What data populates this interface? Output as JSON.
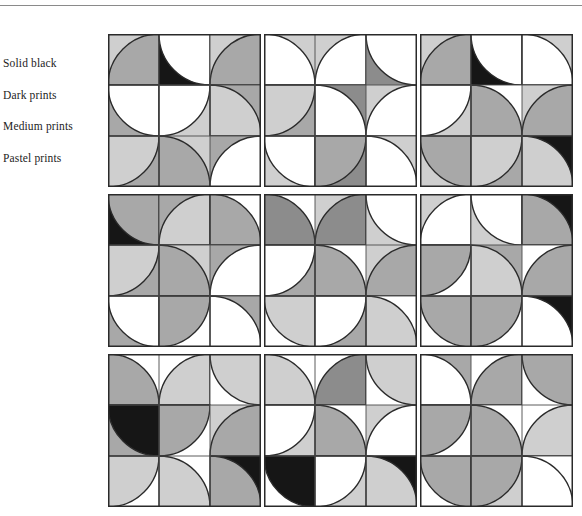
{
  "page": {
    "type": "quilt-block-value-study",
    "background_color": "#ffffff",
    "has_top_rule": true,
    "top_rule_color": "#8a8a8a"
  },
  "legend": {
    "items": [
      {
        "label": "Solid black",
        "value_key": "black",
        "color": "#161616"
      },
      {
        "label": "Dark prints",
        "value_key": "dark",
        "color": "#8c8c8c"
      },
      {
        "label": "Medium prints",
        "value_key": "medium",
        "color": "#a8a8a8"
      },
      {
        "label": "Pastel prints",
        "value_key": "pastel",
        "color": "#cfcfcf"
      }
    ]
  },
  "palette": {
    "black": "#161616",
    "dark": "#8c8c8c",
    "medium": "#a8a8a8",
    "pastel": "#cfcfcf",
    "white": "#ffffff",
    "outline": "#2a2a2a",
    "gridline": "#4a4a4a"
  },
  "quilt": {
    "rows": 3,
    "cols": 3,
    "block_cells": 3,
    "cell_size": 51,
    "description": "Nine drunkard's path sampler blocks; each block is a 3x3 grid of quarter-circle units rotated into pinwheel curves.",
    "blocks": [
      {
        "name": "block-1",
        "cells": [
          {
            "rot": 180,
            "arc": "medium",
            "bg": "pastel"
          },
          {
            "rot": 90,
            "arc": "white",
            "bg": "black"
          },
          {
            "rot": 180,
            "arc": "medium",
            "bg": "pastel"
          },
          {
            "rot": 90,
            "arc": "white",
            "bg": "medium"
          },
          {
            "rot": 0,
            "arc": "white",
            "bg": "pastel"
          },
          {
            "rot": 270,
            "arc": "pastel",
            "bg": "medium"
          },
          {
            "rot": 0,
            "arc": "pastel",
            "bg": "medium"
          },
          {
            "rot": 270,
            "arc": "medium",
            "bg": "pastel"
          },
          {
            "rot": 180,
            "arc": "white",
            "bg": "medium"
          }
        ]
      },
      {
        "name": "block-2",
        "cells": [
          {
            "rot": 270,
            "arc": "white",
            "bg": "pastel"
          },
          {
            "rot": 180,
            "arc": "white",
            "bg": "pastel"
          },
          {
            "rot": 90,
            "arc": "white",
            "bg": "dark"
          },
          {
            "rot": 0,
            "arc": "pastel",
            "bg": "medium"
          },
          {
            "rot": 270,
            "arc": "white",
            "bg": "dark"
          },
          {
            "rot": 180,
            "arc": "white",
            "bg": "pastel"
          },
          {
            "rot": 90,
            "arc": "white",
            "bg": "pastel"
          },
          {
            "rot": 0,
            "arc": "medium",
            "bg": "dark"
          },
          {
            "rot": 270,
            "arc": "white",
            "bg": "pastel"
          }
        ]
      },
      {
        "name": "block-3",
        "cells": [
          {
            "rot": 180,
            "arc": "medium",
            "bg": "pastel"
          },
          {
            "rot": 90,
            "arc": "white",
            "bg": "black"
          },
          {
            "rot": 270,
            "arc": "white",
            "bg": "pastel"
          },
          {
            "rot": 0,
            "arc": "white",
            "bg": "pastel"
          },
          {
            "rot": 270,
            "arc": "medium",
            "bg": "white"
          },
          {
            "rot": 180,
            "arc": "medium",
            "bg": "pastel"
          },
          {
            "rot": 90,
            "arc": "medium",
            "bg": "pastel"
          },
          {
            "rot": 0,
            "arc": "pastel",
            "bg": "medium"
          },
          {
            "rot": 270,
            "arc": "pastel",
            "bg": "black"
          }
        ]
      },
      {
        "name": "block-4",
        "cells": [
          {
            "rot": 90,
            "arc": "medium",
            "bg": "black"
          },
          {
            "rot": 180,
            "arc": "pastel",
            "bg": "medium"
          },
          {
            "rot": 270,
            "arc": "medium",
            "bg": "white"
          },
          {
            "rot": 0,
            "arc": "pastel",
            "bg": "medium"
          },
          {
            "rot": 270,
            "arc": "medium",
            "bg": "pastel"
          },
          {
            "rot": 180,
            "arc": "white",
            "bg": "medium"
          },
          {
            "rot": 90,
            "arc": "white",
            "bg": "medium"
          },
          {
            "rot": 0,
            "arc": "medium",
            "bg": "white"
          },
          {
            "rot": 270,
            "arc": "white",
            "bg": "medium"
          }
        ]
      },
      {
        "name": "block-5",
        "cells": [
          {
            "rot": 270,
            "arc": "dark",
            "bg": "white"
          },
          {
            "rot": 180,
            "arc": "dark",
            "bg": "pastel"
          },
          {
            "rot": 90,
            "arc": "white",
            "bg": "pastel"
          },
          {
            "rot": 0,
            "arc": "white",
            "bg": "medium"
          },
          {
            "rot": 270,
            "arc": "medium",
            "bg": "white"
          },
          {
            "rot": 180,
            "arc": "medium",
            "bg": "pastel"
          },
          {
            "rot": 90,
            "arc": "pastel",
            "bg": "white"
          },
          {
            "rot": 0,
            "arc": "white",
            "bg": "medium"
          },
          {
            "rot": 270,
            "arc": "pastel",
            "bg": "white"
          }
        ]
      },
      {
        "name": "block-6",
        "cells": [
          {
            "rot": 180,
            "arc": "white",
            "bg": "pastel"
          },
          {
            "rot": 90,
            "arc": "white",
            "bg": "pastel"
          },
          {
            "rot": 270,
            "arc": "medium",
            "bg": "black"
          },
          {
            "rot": 0,
            "arc": "medium",
            "bg": "white"
          },
          {
            "rot": 270,
            "arc": "pastel",
            "bg": "medium"
          },
          {
            "rot": 180,
            "arc": "medium",
            "bg": "white"
          },
          {
            "rot": 90,
            "arc": "medium",
            "bg": "white"
          },
          {
            "rot": 0,
            "arc": "medium",
            "bg": "white"
          },
          {
            "rot": 270,
            "arc": "white",
            "bg": "black"
          }
        ]
      },
      {
        "name": "block-7",
        "cells": [
          {
            "rot": 270,
            "arc": "medium",
            "bg": "white"
          },
          {
            "rot": 180,
            "arc": "pastel",
            "bg": "white"
          },
          {
            "rot": 90,
            "arc": "pastel",
            "bg": "white"
          },
          {
            "rot": 90,
            "arc": "black",
            "bg": "medium"
          },
          {
            "rot": 0,
            "arc": "medium",
            "bg": "white"
          },
          {
            "rot": 180,
            "arc": "medium",
            "bg": "pastel"
          },
          {
            "rot": 0,
            "arc": "pastel",
            "bg": "white"
          },
          {
            "rot": 270,
            "arc": "pastel",
            "bg": "white"
          },
          {
            "rot": 270,
            "arc": "medium",
            "bg": "black"
          }
        ]
      },
      {
        "name": "block-8",
        "cells": [
          {
            "rot": 270,
            "arc": "pastel",
            "bg": "white"
          },
          {
            "rot": 180,
            "arc": "dark",
            "bg": "white"
          },
          {
            "rot": 90,
            "arc": "pastel",
            "bg": "white"
          },
          {
            "rot": 0,
            "arc": "white",
            "bg": "pastel"
          },
          {
            "rot": 270,
            "arc": "medium",
            "bg": "white"
          },
          {
            "rot": 180,
            "arc": "white",
            "bg": "pastel"
          },
          {
            "rot": 90,
            "arc": "black",
            "bg": "white"
          },
          {
            "rot": 0,
            "arc": "white",
            "bg": "pastel"
          },
          {
            "rot": 270,
            "arc": "pastel",
            "bg": "black"
          }
        ]
      },
      {
        "name": "block-9",
        "cells": [
          {
            "rot": 270,
            "arc": "white",
            "bg": "medium"
          },
          {
            "rot": 180,
            "arc": "medium",
            "bg": "white"
          },
          {
            "rot": 90,
            "arc": "medium",
            "bg": "white"
          },
          {
            "rot": 0,
            "arc": "medium",
            "bg": "white"
          },
          {
            "rot": 270,
            "arc": "medium",
            "bg": "white"
          },
          {
            "rot": 180,
            "arc": "pastel",
            "bg": "white"
          },
          {
            "rot": 90,
            "arc": "medium",
            "bg": "white"
          },
          {
            "rot": 0,
            "arc": "medium",
            "bg": "pastel"
          },
          {
            "rot": 270,
            "arc": "white",
            "bg": "white"
          }
        ]
      }
    ]
  }
}
